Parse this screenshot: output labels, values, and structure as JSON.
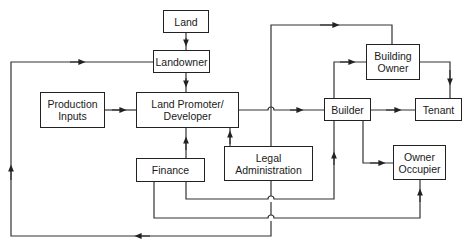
{
  "diagram": {
    "type": "flow",
    "nodes": [
      {
        "id": "land",
        "label": "Land"
      },
      {
        "id": "landowner",
        "label": "Landowner"
      },
      {
        "id": "production_inputs",
        "label": "Production\nInputs"
      },
      {
        "id": "land_promoter",
        "label": "Land Promoter/\nDeveloper"
      },
      {
        "id": "finance",
        "label": "Finance"
      },
      {
        "id": "legal_admin",
        "label": "Legal\nAdministration"
      },
      {
        "id": "builder",
        "label": "Builder"
      },
      {
        "id": "building_owner",
        "label": "Building\nOwner"
      },
      {
        "id": "tenant",
        "label": "Tenant"
      },
      {
        "id": "owner_occupier",
        "label": "Owner\nOccupier"
      }
    ],
    "edges": [
      {
        "from": "land",
        "to": "landowner"
      },
      {
        "from": "landowner",
        "to": "land_promoter"
      },
      {
        "from": "production_inputs",
        "to": "land_promoter"
      },
      {
        "from": "finance",
        "to": "land_promoter"
      },
      {
        "from": "legal_admin",
        "to": "land_promoter"
      },
      {
        "from": "land_promoter",
        "to": "builder"
      },
      {
        "from": "builder",
        "to": "building_owner"
      },
      {
        "from": "builder",
        "to": "tenant"
      },
      {
        "from": "builder",
        "to": "owner_occupier"
      },
      {
        "from": "building_owner",
        "to": "tenant"
      },
      {
        "from": "legal_admin",
        "to": "building_owner"
      },
      {
        "from": "finance",
        "to": "builder"
      },
      {
        "from": "finance",
        "to": "owner_occupier"
      },
      {
        "from": "legal_admin",
        "to": "landowner"
      }
    ]
  }
}
